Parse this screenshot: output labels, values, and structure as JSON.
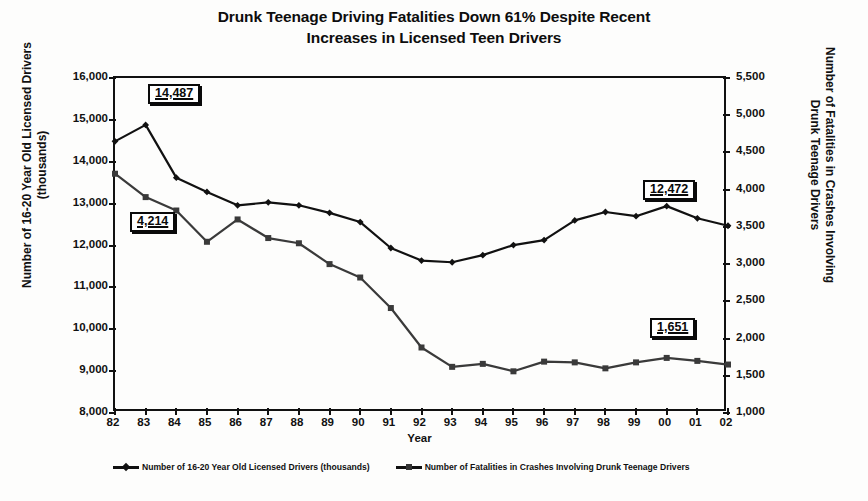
{
  "title": {
    "line1": "Drunk Teenage Driving Fatalities Down 61% Despite Recent",
    "line2": "Increases in Licensed Teen Drivers"
  },
  "chart_data": {
    "type": "line",
    "title": "Drunk Teenage Driving Fatalities Down 61% Despite Recent Increases in Licensed Teen Drivers",
    "xlabel": "Year",
    "grid": false,
    "legend_position": "bottom",
    "categories": [
      "82",
      "83",
      "84",
      "85",
      "86",
      "87",
      "88",
      "89",
      "90",
      "91",
      "92",
      "93",
      "94",
      "95",
      "96",
      "97",
      "98",
      "99",
      "00",
      "01",
      "02"
    ],
    "axes": {
      "left": {
        "label": "Number of 16-20 Year Old Licensed Drivers (thousands)",
        "ticks": [
          "8,000",
          "9,000",
          "10,000",
          "11,000",
          "12,000",
          "13,000",
          "14,000",
          "15,000",
          "16,000"
        ],
        "min": 8000,
        "max": 16000,
        "step": 1000
      },
      "right": {
        "label": "Number of Fatalities in Crashes Involving Drunk Teenage Drivers",
        "ticks": [
          "1,000",
          "1,500",
          "2,000",
          "2,500",
          "3,000",
          "3,500",
          "4,000",
          "4,500",
          "5,000",
          "5,500"
        ],
        "min": 1000,
        "max": 5500,
        "step": 500
      }
    },
    "series": [
      {
        "name": "Number of 16-20 Year Old Licensed Drivers (thousands)",
        "axis": "left",
        "marker": "diamond",
        "color": "#111111",
        "values": [
          14487,
          14880,
          13620,
          13280,
          12960,
          13030,
          12960,
          12780,
          12560,
          11940,
          11640,
          11600,
          11770,
          12010,
          12130,
          12600,
          12800,
          12700,
          12940,
          12650,
          12472
        ]
      },
      {
        "name": "Number of Fatalities in Crashes Involving Drunk Teenage Drivers",
        "axis": "right",
        "marker": "square",
        "color": "#3a3a3a",
        "values": [
          4214,
          3900,
          3720,
          3300,
          3600,
          3350,
          3280,
          3000,
          2820,
          2410,
          1880,
          1620,
          1660,
          1560,
          1690,
          1680,
          1600,
          1680,
          1740,
          1700,
          1651
        ]
      }
    ],
    "annotations": [
      {
        "text": "14,487",
        "series": 0,
        "category": "82",
        "x": 148,
        "y": 84
      },
      {
        "text": "4,214",
        "series": 1,
        "category": "82",
        "x": 130,
        "y": 212
      },
      {
        "text": "12,472",
        "series": 0,
        "category": "02",
        "x": 643,
        "y": 180
      },
      {
        "text": "1,651",
        "series": 1,
        "category": "02",
        "x": 650,
        "y": 318
      }
    ]
  },
  "legend": {
    "items": [
      {
        "label": "Number of 16-20 Year Old Licensed Drivers (thousands)",
        "marker": "diamond"
      },
      {
        "label": "Number of Fatalities in Crashes Involving Drunk Teenage Drivers",
        "marker": "square"
      }
    ]
  },
  "xtitle": "Year"
}
